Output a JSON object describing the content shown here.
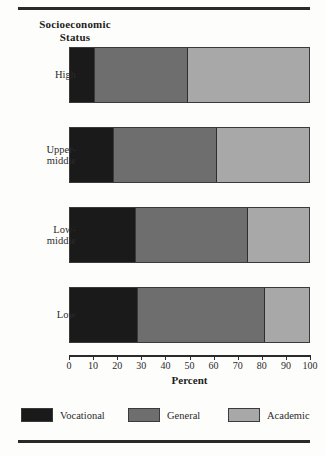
{
  "figure": {
    "y_axis_title_line1": "Socioeconomic",
    "y_axis_title_line2": "Status"
  },
  "chart_data": {
    "type": "bar",
    "orientation": "horizontal",
    "stacked": true,
    "title": "Socioeconomic Status",
    "xlabel": "Percent",
    "ylabel": "Socioeconomic Status",
    "xlim": [
      0,
      100
    ],
    "xticks": [
      0,
      10,
      20,
      30,
      40,
      50,
      60,
      70,
      80,
      90,
      100
    ],
    "xtick_labels": [
      "0",
      "10",
      "20",
      "30",
      "40",
      "50",
      "60",
      "70",
      "80",
      "90",
      "100"
    ],
    "grid": false,
    "legend_position": "bottom",
    "categories": [
      "High",
      "Upper-middle",
      "Low-middle",
      "Low"
    ],
    "category_labels": [
      [
        "High"
      ],
      [
        "Upper-",
        "middle"
      ],
      [
        "Low-",
        "middle"
      ],
      [
        "Low"
      ]
    ],
    "series": [
      {
        "name": "Vocational",
        "color": "#1a1a1a",
        "values": [
          10,
          18,
          27,
          28
        ]
      },
      {
        "name": "General",
        "color": "#6e6e6e",
        "values": [
          39,
          43,
          47,
          53
        ]
      },
      {
        "name": "Academic",
        "color": "#a8a8a8",
        "values": [
          51,
          39,
          26,
          19
        ]
      }
    ],
    "cumulative_boundaries": [
      [
        10,
        49
      ],
      [
        18,
        61
      ],
      [
        27,
        74
      ],
      [
        28,
        81
      ]
    ]
  },
  "legend": {
    "items": [
      {
        "label": "Vocational",
        "color": "#1a1a1a"
      },
      {
        "label": "General",
        "color": "#6e6e6e"
      },
      {
        "label": "Academic",
        "color": "#a8a8a8"
      }
    ]
  }
}
